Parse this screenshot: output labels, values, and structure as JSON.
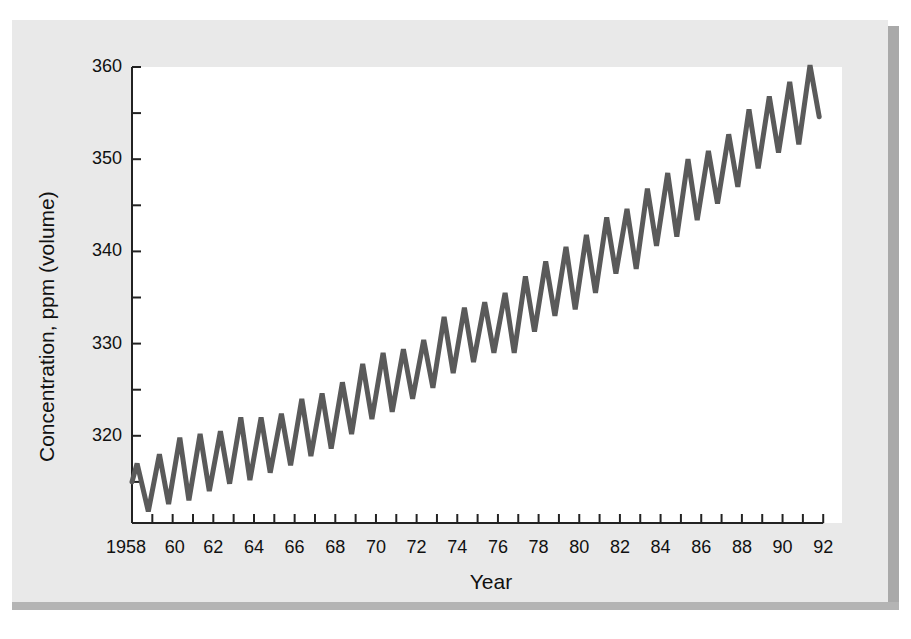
{
  "chart_data": {
    "type": "line",
    "title": "",
    "xlabel": "Year",
    "ylabel": "Concentration, ppm (volume)",
    "xlim": [
      1958,
      1992
    ],
    "ylim": [
      311,
      360
    ],
    "grid": false,
    "legend": null,
    "x_tick_labels": [
      "1958",
      "60",
      "62",
      "64",
      "66",
      "68",
      "70",
      "72",
      "74",
      "76",
      "78",
      "80",
      "82",
      "84",
      "86",
      "88",
      "90",
      "92"
    ],
    "x_tick_values": [
      1958,
      1960,
      1962,
      1964,
      1966,
      1968,
      1970,
      1972,
      1974,
      1976,
      1978,
      1980,
      1982,
      1984,
      1986,
      1988,
      1990,
      1992
    ],
    "x_minor_ticks_every": 1,
    "y_tick_labels": [
      "320",
      "330",
      "340",
      "350",
      "360"
    ],
    "y_tick_values": [
      320,
      330,
      340,
      350,
      360
    ],
    "y_minor_ticks_every": 5,
    "series": [
      {
        "name": "Atmospheric CO2 (seasonal cycle)",
        "color": "#5a5a5a",
        "x": [
          1958.0,
          1958.25,
          1958.8,
          1959.35,
          1959.8,
          1960.35,
          1960.8,
          1961.35,
          1961.8,
          1962.35,
          1962.8,
          1963.35,
          1963.8,
          1964.35,
          1964.8,
          1965.35,
          1965.8,
          1966.35,
          1966.8,
          1967.35,
          1967.8,
          1968.35,
          1968.8,
          1969.35,
          1969.8,
          1970.35,
          1970.8,
          1971.35,
          1971.8,
          1972.35,
          1972.8,
          1973.35,
          1973.8,
          1974.35,
          1974.8,
          1975.35,
          1975.8,
          1976.35,
          1976.8,
          1977.35,
          1977.8,
          1978.35,
          1978.8,
          1979.35,
          1979.8,
          1980.35,
          1980.8,
          1981.35,
          1981.8,
          1982.35,
          1982.8,
          1983.35,
          1983.8,
          1984.35,
          1984.8,
          1985.35,
          1985.8,
          1986.35,
          1986.8,
          1987.35,
          1987.8,
          1988.35,
          1988.8,
          1989.35,
          1989.8,
          1990.35,
          1990.8,
          1991.35,
          1991.8
        ],
        "values": [
          315.0,
          317.0,
          311.8,
          318.0,
          312.6,
          319.8,
          313.0,
          320.2,
          314.0,
          320.5,
          314.8,
          322.0,
          315.2,
          322.0,
          316.0,
          322.4,
          316.8,
          324.0,
          317.8,
          324.6,
          318.6,
          325.8,
          320.2,
          327.8,
          321.8,
          329.0,
          322.6,
          329.4,
          324.0,
          330.4,
          325.2,
          332.9,
          326.8,
          333.9,
          328.0,
          334.5,
          329.0,
          335.5,
          329.0,
          337.3,
          331.3,
          338.9,
          333.0,
          340.5,
          333.7,
          341.8,
          335.5,
          343.7,
          337.6,
          344.6,
          338.1,
          346.8,
          340.6,
          348.5,
          341.6,
          350.0,
          343.4,
          350.9,
          345.2,
          352.7,
          347.0,
          355.4,
          349.0,
          356.8,
          350.7,
          358.4,
          351.6,
          360.2,
          354.6
        ]
      }
    ]
  },
  "layout": {
    "plot_left": 132,
    "plot_right": 842,
    "plot_top": 67,
    "plot_bottom": 523,
    "x_px_per_year": 20.33,
    "y_px_per_ppm": 9.22
  }
}
